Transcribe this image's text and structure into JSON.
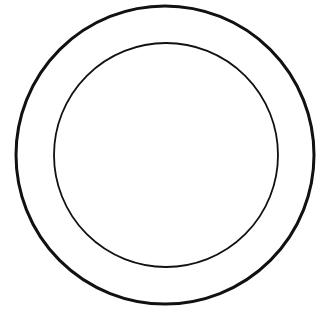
{
  "figure": {
    "outer_circle": {
      "cx": 165,
      "cy": 155,
      "r": 149,
      "stroke": "#111111",
      "stroke_width": 3
    },
    "inner_circle": {
      "cx": 166,
      "cy": 155,
      "r": 112,
      "stroke": "#111111",
      "stroke_width": 1.8
    },
    "caption": ""
  }
}
